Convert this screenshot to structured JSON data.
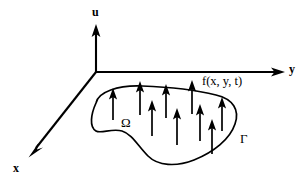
{
  "figure": {
    "background_color": "#ffffff",
    "stroke_color": "#000000",
    "width": 308,
    "height": 185,
    "axes": {
      "origin": {
        "x": 96,
        "y": 72
      },
      "items": [
        {
          "id": "u-axis",
          "label": "u",
          "direction": "up",
          "tip": {
            "x": 96,
            "y": 25
          },
          "tail": {
            "x": 96,
            "y": 72
          }
        },
        {
          "id": "y-axis",
          "label": "y",
          "direction": "right",
          "tip": {
            "x": 285,
            "y": 72
          },
          "tail": {
            "x": 96,
            "y": 72
          }
        },
        {
          "id": "x-axis",
          "label": "x",
          "direction": "down-left",
          "tip": {
            "x": 29,
            "y": 157
          },
          "tail": {
            "x": 96,
            "y": 72
          }
        }
      ]
    },
    "labels": {
      "u_axis": "u",
      "y_axis": "y",
      "x_axis": "x",
      "domain": "Ω",
      "boundary": "Γ",
      "load_function": "f(x, y, t)"
    },
    "domain_outline": {
      "name": "omega-region-boundary",
      "closed": true,
      "path": "M 96 103 C 98 92 118 85 142 86 C 168 87 196 90 216 95 C 233 99 240 110 235 124 C 230 139 214 152 194 160 C 176 167 158 166 148 156 C 138 146 132 134 122 131 C 112 128 101 134 96 131 C 89 127 91 114 96 103 Z"
    },
    "load_arrows": {
      "name": "distributed-load-arrows",
      "count": 12,
      "description": "Upward arrows representing f(x, y, t) acting over the domain",
      "items": [
        {
          "x": 113,
          "tip_y": 88,
          "base_y": 120
        },
        {
          "x": 140,
          "tip_y": 81,
          "base_y": 115
        },
        {
          "x": 166,
          "tip_y": 84,
          "base_y": 118
        },
        {
          "x": 192,
          "tip_y": 80,
          "base_y": 114
        },
        {
          "x": 222,
          "tip_y": 97,
          "base_y": 131
        },
        {
          "x": 152,
          "tip_y": 100,
          "base_y": 136
        },
        {
          "x": 177,
          "tip_y": 108,
          "base_y": 145
        },
        {
          "x": 200,
          "tip_y": 104,
          "base_y": 141
        },
        {
          "x": 212,
          "tip_y": 119,
          "base_y": 154
        }
      ]
    }
  }
}
